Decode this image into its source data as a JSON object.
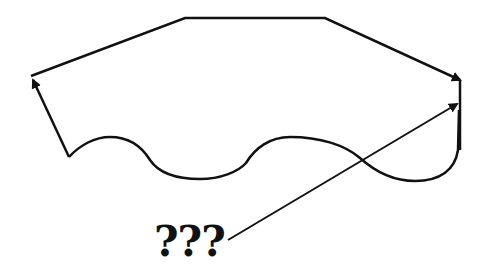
{
  "diagram": {
    "label": "???",
    "stroke_color": "#111111",
    "background": "#ffffff",
    "elements": {
      "top_path": "arrow path from left vertex across the top to the right side",
      "left_arrow": "arrow from wavy-bottom start up to left vertex",
      "wavy_bottom": "wavy curve along the bottom ending at right vertical line",
      "right_edge": "vertical segment on right side",
      "pointer_line": "line from ??? label to right side with arrowhead"
    }
  }
}
